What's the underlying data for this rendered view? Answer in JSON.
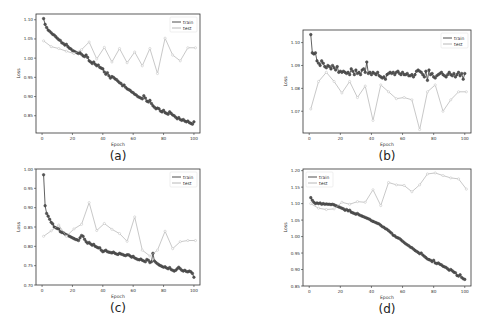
{
  "figure": {
    "panels": [
      "a",
      "b",
      "c",
      "d"
    ]
  },
  "colors": {
    "train": "#3a3a3a",
    "train_marker": "#555555",
    "test": "#b0b0b0",
    "test_marker": "#bdbdbd",
    "axis": "#333333"
  },
  "chart_data": [
    {
      "id": "a",
      "caption": "(a)",
      "type": "line",
      "xlabel": "Epoch",
      "ylabel": "Loss",
      "xlim": [
        -4,
        104
      ],
      "ylim": [
        0.805,
        1.115
      ],
      "xticks": [
        0,
        20,
        40,
        60,
        80,
        100
      ],
      "yticks": [
        0.85,
        0.9,
        0.95,
        1.0,
        1.05,
        1.1
      ],
      "ytick_labels": [
        "0.85",
        "0.90",
        "0.95",
        "1.00",
        "1.05",
        "1.10"
      ],
      "legend": {
        "position": "upper right",
        "entries": [
          "train",
          "test"
        ]
      },
      "frame": {
        "x": 36,
        "y": 14,
        "w": 164,
        "h": 119
      },
      "series": [
        {
          "name": "train",
          "x_start": 1,
          "x_step": 1,
          "values": [
            1.103,
            1.088,
            1.08,
            1.073,
            1.07,
            1.066,
            1.062,
            1.06,
            1.056,
            1.052,
            1.048,
            1.046,
            1.04,
            1.038,
            1.034,
            1.036,
            1.03,
            1.026,
            1.024,
            1.02,
            1.018,
            1.016,
            1.014,
            1.012,
            1.014,
            1.01,
            1.006,
            1.004,
            1.008,
            1.002,
            0.993,
            0.99,
            0.986,
            0.99,
            0.984,
            0.98,
            0.982,
            0.976,
            0.974,
            0.972,
            0.964,
            0.958,
            0.962,
            0.954,
            0.948,
            0.952,
            0.95,
            0.946,
            0.944,
            0.94,
            0.936,
            0.934,
            0.928,
            0.93,
            0.924,
            0.92,
            0.918,
            0.916,
            0.912,
            0.91,
            0.906,
            0.904,
            0.9,
            0.898,
            0.896,
            0.894,
            0.902,
            0.896,
            0.888,
            0.886,
            0.89,
            0.882,
            0.876,
            0.872,
            0.868,
            0.87,
            0.868,
            0.862,
            0.86,
            0.864,
            0.858,
            0.856,
            0.854,
            0.86,
            0.856,
            0.852,
            0.85,
            0.846,
            0.842,
            0.845,
            0.84,
            0.838,
            0.84,
            0.836,
            0.834,
            0.836,
            0.832,
            0.83,
            0.828,
            0.834
          ]
        },
        {
          "name": "test",
          "x": [
            1,
            6,
            11,
            16,
            21,
            26,
            31,
            36,
            41,
            46,
            51,
            56,
            61,
            66,
            71,
            76,
            81,
            86,
            91,
            96,
            101
          ],
          "values": [
            1.045,
            1.03,
            1.025,
            1.018,
            1.012,
            1.022,
            1.042,
            0.998,
            1.028,
            0.99,
            1.025,
            0.988,
            1.016,
            0.98,
            1.025,
            0.96,
            1.052,
            1.008,
            0.993,
            1.027,
            1.027
          ]
        }
      ]
    },
    {
      "id": "b",
      "caption": "(b)",
      "type": "line",
      "xlabel": "Epoch",
      "ylabel": "Loss",
      "xlim": [
        -4,
        104
      ],
      "ylim": [
        1.0605,
        1.1055
      ],
      "xticks": [
        0,
        20,
        40,
        60,
        80,
        100
      ],
      "yticks": [
        1.07,
        1.08,
        1.09,
        1.1
      ],
      "ytick_labels": [
        "1.07",
        "1.08",
        "1.09",
        "1.10"
      ],
      "legend": {
        "position": "upper right",
        "entries": [
          "train",
          "test"
        ]
      },
      "frame": {
        "x": 303,
        "y": 30,
        "w": 168,
        "h": 103
      },
      "series": [
        {
          "name": "train",
          "x_start": 1,
          "x_step": 1,
          "values": [
            1.1035,
            1.0955,
            1.095,
            1.0955,
            1.092,
            1.091,
            1.09,
            1.092,
            1.091,
            1.0895,
            1.089,
            1.09,
            1.0895,
            1.0885,
            1.09,
            1.089,
            1.088,
            1.0895,
            1.087,
            1.0875,
            1.087,
            1.0875,
            1.087,
            1.0865,
            1.087,
            1.086,
            1.0885,
            1.0875,
            1.086,
            1.088,
            1.0865,
            1.087,
            1.086,
            1.088,
            1.0885,
            1.087,
            1.0915,
            1.0865,
            1.087,
            1.086,
            1.087,
            1.0865,
            1.086,
            1.087,
            1.0855,
            1.085,
            1.0845,
            1.085,
            1.084,
            1.086,
            1.0865,
            1.087,
            1.0865,
            1.087,
            1.086,
            1.087,
            1.0875,
            1.0865,
            1.086,
            1.087,
            1.086,
            1.086,
            1.0865,
            1.0855,
            1.0855,
            1.086,
            1.085,
            1.086,
            1.0875,
            1.088,
            1.0875,
            1.087,
            1.086,
            1.085,
            1.0875,
            1.0835,
            1.088,
            1.086,
            1.0865,
            1.085,
            1.0845,
            1.0855,
            1.086,
            1.0865,
            1.087,
            1.086,
            1.0855,
            1.085,
            1.086,
            1.087,
            1.086,
            1.0855,
            1.0865,
            1.085,
            1.086,
            1.087,
            1.0855,
            1.0865,
            1.084,
            1.0865
          ]
        },
        {
          "name": "test",
          "x": [
            1,
            6,
            11,
            16,
            21,
            26,
            31,
            36,
            41,
            46,
            51,
            56,
            61,
            66,
            71,
            76,
            81,
            86,
            91,
            96,
            101
          ],
          "values": [
            1.071,
            1.083,
            1.087,
            1.083,
            1.078,
            1.083,
            1.076,
            1.081,
            1.066,
            1.0815,
            1.0785,
            1.0755,
            1.076,
            1.075,
            1.062,
            1.0785,
            1.0815,
            1.07,
            1.075,
            1.0785,
            1.0785
          ]
        }
      ]
    },
    {
      "id": "c",
      "caption": "(c)",
      "type": "line",
      "xlabel": "Epoch",
      "ylabel": "Loss",
      "xlim": [
        -4,
        104
      ],
      "ylim": [
        0.7,
        1.0
      ],
      "xticks": [
        0,
        20,
        40,
        60,
        80,
        100
      ],
      "yticks": [
        0.7,
        0.75,
        0.8,
        0.85,
        0.9,
        0.95,
        1.0
      ],
      "ytick_labels": [
        "0.70",
        "0.75",
        "0.80",
        "0.85",
        "0.90",
        "0.95",
        "1.00"
      ],
      "legend": {
        "position": "upper right",
        "entries": [
          "train",
          "test"
        ]
      },
      "frame": {
        "x": 36,
        "y": 169,
        "w": 164,
        "h": 116
      },
      "series": [
        {
          "name": "train",
          "x_start": 1,
          "x_step": 1,
          "values": [
            0.985,
            0.905,
            0.885,
            0.878,
            0.87,
            0.862,
            0.858,
            0.85,
            0.848,
            0.846,
            0.845,
            0.838,
            0.836,
            0.835,
            0.832,
            0.83,
            0.828,
            0.826,
            0.824,
            0.822,
            0.82,
            0.818,
            0.817,
            0.815,
            0.822,
            0.828,
            0.826,
            0.818,
            0.812,
            0.808,
            0.81,
            0.806,
            0.803,
            0.805,
            0.8,
            0.798,
            0.796,
            0.796,
            0.79,
            0.786,
            0.788,
            0.79,
            0.786,
            0.785,
            0.784,
            0.783,
            0.785,
            0.782,
            0.78,
            0.779,
            0.782,
            0.78,
            0.779,
            0.777,
            0.776,
            0.778,
            0.778,
            0.775,
            0.772,
            0.774,
            0.77,
            0.768,
            0.766,
            0.765,
            0.767,
            0.764,
            0.762,
            0.76,
            0.766,
            0.764,
            0.758,
            0.76,
            0.782,
            0.762,
            0.758,
            0.755,
            0.752,
            0.75,
            0.748,
            0.746,
            0.747,
            0.744,
            0.742,
            0.745,
            0.74,
            0.738,
            0.736,
            0.738,
            0.742,
            0.746,
            0.742,
            0.738,
            0.736,
            0.738,
            0.735,
            0.734,
            0.736,
            0.734,
            0.73,
            0.72
          ]
        },
        {
          "name": "test",
          "x": [
            1,
            6,
            11,
            16,
            21,
            26,
            31,
            36,
            41,
            46,
            51,
            56,
            61,
            66,
            71,
            76,
            81,
            86,
            91,
            96,
            101
          ],
          "values": [
            0.826,
            0.84,
            0.855,
            0.826,
            0.845,
            0.857,
            0.913,
            0.841,
            0.859,
            0.844,
            0.833,
            0.813,
            0.876,
            0.79,
            0.775,
            0.79,
            0.839,
            0.794,
            0.812,
            0.815,
            0.815
          ]
        }
      ]
    },
    {
      "id": "d",
      "caption": "(d)",
      "type": "line",
      "xlabel": "Epoch",
      "ylabel": "Loss",
      "xlim": [
        -4,
        104
      ],
      "ylim": [
        0.85,
        1.205
      ],
      "xticks": [
        0,
        20,
        40,
        60,
        80,
        100
      ],
      "yticks": [
        0.85,
        0.9,
        0.95,
        1.0,
        1.05,
        1.1,
        1.15,
        1.2
      ],
      "ytick_labels": [
        "0.85",
        "0.90",
        "0.95",
        "1.00",
        "1.05",
        "1.10",
        "1.15",
        "1.20"
      ],
      "legend": {
        "position": "upper left",
        "entries": [
          "train",
          "test"
        ]
      },
      "frame": {
        "x": 303,
        "y": 169,
        "w": 168,
        "h": 117
      },
      "series": [
        {
          "name": "train",
          "x_start": 1,
          "x_step": 1,
          "values": [
            1.118,
            1.11,
            1.104,
            1.1,
            1.102,
            1.1,
            1.102,
            1.098,
            1.1,
            1.098,
            1.099,
            1.098,
            1.098,
            1.097,
            1.098,
            1.096,
            1.094,
            1.092,
            1.09,
            1.088,
            1.086,
            1.084,
            1.08,
            1.082,
            1.078,
            1.08,
            1.074,
            1.072,
            1.07,
            1.068,
            1.07,
            1.066,
            1.064,
            1.062,
            1.06,
            1.058,
            1.056,
            1.054,
            1.052,
            1.048,
            1.046,
            1.044,
            1.042,
            1.04,
            1.038,
            1.034,
            1.03,
            1.028,
            1.024,
            1.022,
            1.018,
            1.014,
            1.01,
            1.004,
            1.002,
            0.998,
            0.996,
            0.994,
            0.99,
            0.986,
            0.982,
            0.978,
            0.975,
            0.972,
            0.968,
            0.966,
            0.962,
            0.958,
            0.955,
            0.952,
            0.948,
            0.95,
            0.944,
            0.94,
            0.936,
            0.932,
            0.93,
            0.928,
            0.924,
            0.928,
            0.92,
            0.918,
            0.92,
            0.916,
            0.914,
            0.91,
            0.908,
            0.906,
            0.902,
            0.898,
            0.9,
            0.896,
            0.892,
            0.89,
            0.882,
            0.88,
            0.884,
            0.876,
            0.872,
            0.87
          ]
        },
        {
          "name": "test",
          "x": [
            1,
            6,
            11,
            16,
            21,
            26,
            31,
            36,
            41,
            46,
            51,
            56,
            61,
            66,
            71,
            76,
            81,
            86,
            91,
            96,
            101
          ],
          "values": [
            1.1,
            1.086,
            1.082,
            1.084,
            1.104,
            1.098,
            1.106,
            1.104,
            1.142,
            1.094,
            1.164,
            1.157,
            1.155,
            1.136,
            1.157,
            1.19,
            1.193,
            1.185,
            1.178,
            1.175,
            1.144
          ]
        }
      ]
    }
  ]
}
